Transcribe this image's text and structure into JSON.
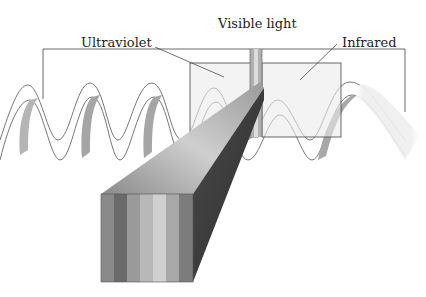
{
  "diagram": {
    "labels": {
      "visible": "Visible light",
      "ultraviolet": "Ultraviolet",
      "infrared": "Infrared"
    },
    "spectrum_band_colors": [
      "#8a8a8a",
      "#6a6a6a",
      "#9a9a9a",
      "#b8b8b8",
      "#d0d0d0",
      "#a8a8a8",
      "#7c7c7c"
    ],
    "colors": {
      "line": "#444444",
      "box_fill": "#ebebeb",
      "wave_front": "#f2f2f2",
      "wave_back": "#a0a0a0"
    }
  }
}
